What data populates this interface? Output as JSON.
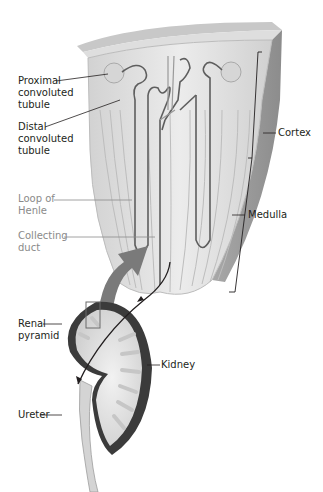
{
  "figure": {
    "type": "anatomical-diagram",
    "colors": {
      "label_dark": "#231f20",
      "label_grey": "#8a8a8a",
      "arrow_grey": "#7a7a7a",
      "kidney_capsule": "#3a3a3a",
      "tissue_light": "#e6e6e6",
      "tissue_mid": "#c4c4c4"
    }
  },
  "labels": {
    "proximal": "Proximal\nconvoluted\ntubule",
    "distal": "Distal\nconvoluted\ntubule",
    "loop": "Loop of\nHenle",
    "collecting": "Collecting\nduct",
    "cortex": "Cortex",
    "medulla": "Medulla",
    "renal_pyramid": "Renal\npyramid",
    "kidney": "Kidney",
    "ureter": "Ureter"
  }
}
